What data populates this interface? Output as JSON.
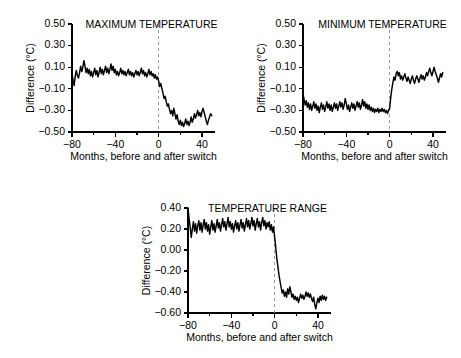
{
  "figure": {
    "background": "#ffffff",
    "line_color": "#000000",
    "switch_marker_color": "#9a9a9a"
  },
  "chart_data": [
    {
      "type": "line",
      "id": "maximum-temperature",
      "title": "MAXIMUM TEMPERATURE",
      "xlabel": "Months, before and after switch",
      "ylabel": "Difference (°C)",
      "xlim": [
        -80,
        52
      ],
      "ylim": [
        -0.5,
        0.5
      ],
      "xticks": [
        -80,
        -40,
        0,
        40
      ],
      "xtick_labels": [
        "−80",
        "−40",
        "0",
        "40"
      ],
      "xminor_ticks": [
        -60,
        -20,
        20
      ],
      "yticks": [
        0.5,
        0.3,
        0.1,
        -0.1,
        -0.3,
        -0.5
      ],
      "ytick_labels": [
        "0.50",
        "0.30",
        "0.10",
        "−0.10",
        "−0.30",
        "−0.50"
      ],
      "grid": false,
      "annotations": [
        {
          "type": "vline",
          "x": 0,
          "style": "dashed",
          "label": "switch"
        }
      ],
      "x": [
        -80,
        -79,
        -78,
        -77,
        -76,
        -75,
        -74,
        -73,
        -72,
        -71,
        -70,
        -69,
        -68,
        -67,
        -66,
        -65,
        -64,
        -63,
        -62,
        -61,
        -60,
        -59,
        -58,
        -57,
        -56,
        -55,
        -54,
        -53,
        -52,
        -51,
        -50,
        -49,
        -48,
        -47,
        -46,
        -45,
        -44,
        -43,
        -42,
        -41,
        -40,
        -39,
        -38,
        -37,
        -36,
        -35,
        -34,
        -33,
        -32,
        -31,
        -30,
        -29,
        -28,
        -27,
        -26,
        -25,
        -24,
        -23,
        -22,
        -21,
        -20,
        -19,
        -18,
        -17,
        -16,
        -15,
        -14,
        -13,
        -12,
        -11,
        -10,
        -9,
        -8,
        -7,
        -6,
        -5,
        -4,
        -3,
        -2,
        -1,
        0,
        1,
        2,
        3,
        4,
        5,
        6,
        7,
        8,
        9,
        10,
        11,
        12,
        13,
        14,
        15,
        16,
        17,
        18,
        19,
        20,
        21,
        22,
        23,
        24,
        25,
        26,
        27,
        28,
        29,
        30,
        31,
        32,
        33,
        34,
        35,
        36,
        37,
        38,
        39,
        40,
        41,
        42,
        43,
        44,
        45,
        46,
        47,
        48,
        49,
        50,
        51,
        52
      ],
      "y": [
        0.04,
        -0.02,
        -0.07,
        0.02,
        0.07,
        0.02,
        0.0,
        0.05,
        0.11,
        0.06,
        0.1,
        0.16,
        0.11,
        0.05,
        0.09,
        0.04,
        0.08,
        0.02,
        0.06,
        0.01,
        0.05,
        0.09,
        0.03,
        0.07,
        0.01,
        0.05,
        0.1,
        0.04,
        0.08,
        0.03,
        0.07,
        0.11,
        0.05,
        0.09,
        0.04,
        0.08,
        0.13,
        0.07,
        0.11,
        0.05,
        0.08,
        0.03,
        0.06,
        0.02,
        0.05,
        0.09,
        0.04,
        0.07,
        0.03,
        0.06,
        0.02,
        0.05,
        0.08,
        0.03,
        0.06,
        0.02,
        0.05,
        0.01,
        0.04,
        0.07,
        0.03,
        0.06,
        0.02,
        0.05,
        0.09,
        0.04,
        0.07,
        0.02,
        0.05,
        0.01,
        0.04,
        0.08,
        0.03,
        0.06,
        0.02,
        0.04,
        0.0,
        0.03,
        -0.01,
        0.01,
        -0.03,
        -0.08,
        -0.05,
        -0.1,
        -0.14,
        -0.19,
        -0.17,
        -0.22,
        -0.26,
        -0.24,
        -0.29,
        -0.33,
        -0.3,
        -0.35,
        -0.28,
        -0.33,
        -0.38,
        -0.34,
        -0.4,
        -0.43,
        -0.39,
        -0.44,
        -0.41,
        -0.45,
        -0.42,
        -0.38,
        -0.43,
        -0.4,
        -0.44,
        -0.41,
        -0.36,
        -0.41,
        -0.38,
        -0.33,
        -0.37,
        -0.34,
        -0.3,
        -0.35,
        -0.32,
        -0.36,
        -0.31,
        -0.28,
        -0.32,
        -0.36,
        -0.4,
        -0.43,
        -0.39,
        -0.36,
        -0.33,
        -0.35
      ]
    },
    {
      "type": "line",
      "id": "minimum-temperature",
      "title": "MINIMUM TEMPERATURE",
      "xlabel": "Months, before and after switch",
      "ylabel": "Difference (°C)",
      "xlim": [
        -80,
        52
      ],
      "ylim": [
        -0.5,
        0.5
      ],
      "xticks": [
        -80,
        -40,
        0,
        40
      ],
      "xtick_labels": [
        "−80",
        "−40",
        "0",
        "40"
      ],
      "xminor_ticks": [
        -60,
        -20,
        20
      ],
      "yticks": [
        0.5,
        0.3,
        0.1,
        -0.1,
        -0.3,
        -0.5
      ],
      "ytick_labels": [
        "0.50",
        "0.30",
        "0.10",
        "−0.10",
        "−0.30",
        "−0.50"
      ],
      "grid": false,
      "annotations": [
        {
          "type": "vline",
          "x": 0,
          "style": "dashed",
          "label": "switch"
        }
      ],
      "x": [
        -80,
        -79,
        -78,
        -77,
        -76,
        -75,
        -74,
        -73,
        -72,
        -71,
        -70,
        -69,
        -68,
        -67,
        -66,
        -65,
        -64,
        -63,
        -62,
        -61,
        -60,
        -59,
        -58,
        -57,
        -56,
        -55,
        -54,
        -53,
        -52,
        -51,
        -50,
        -49,
        -48,
        -47,
        -46,
        -45,
        -44,
        -43,
        -42,
        -41,
        -40,
        -39,
        -38,
        -37,
        -36,
        -35,
        -34,
        -33,
        -32,
        -31,
        -30,
        -29,
        -28,
        -27,
        -26,
        -25,
        -24,
        -23,
        -22,
        -21,
        -20,
        -19,
        -18,
        -17,
        -16,
        -15,
        -14,
        -13,
        -12,
        -11,
        -10,
        -9,
        -8,
        -7,
        -6,
        -5,
        -4,
        -3,
        -2,
        -1,
        0,
        1,
        2,
        3,
        4,
        5,
        6,
        7,
        8,
        9,
        10,
        11,
        12,
        13,
        14,
        15,
        16,
        17,
        18,
        19,
        20,
        21,
        22,
        23,
        24,
        25,
        26,
        27,
        28,
        29,
        30,
        31,
        32,
        33,
        34,
        35,
        36,
        37,
        38,
        39,
        40,
        41,
        42,
        43,
        44,
        45,
        46,
        47,
        48,
        49,
        50,
        51,
        52
      ],
      "y": [
        -0.14,
        -0.2,
        -0.25,
        -0.21,
        -0.27,
        -0.23,
        -0.29,
        -0.24,
        -0.3,
        -0.26,
        -0.22,
        -0.28,
        -0.24,
        -0.3,
        -0.26,
        -0.32,
        -0.27,
        -0.23,
        -0.29,
        -0.25,
        -0.31,
        -0.27,
        -0.22,
        -0.28,
        -0.24,
        -0.3,
        -0.25,
        -0.31,
        -0.27,
        -0.23,
        -0.28,
        -0.24,
        -0.3,
        -0.26,
        -0.22,
        -0.27,
        -0.23,
        -0.29,
        -0.25,
        -0.19,
        -0.24,
        -0.29,
        -0.25,
        -0.31,
        -0.27,
        -0.23,
        -0.28,
        -0.24,
        -0.3,
        -0.26,
        -0.22,
        -0.27,
        -0.23,
        -0.29,
        -0.25,
        -0.2,
        -0.26,
        -0.22,
        -0.28,
        -0.24,
        -0.29,
        -0.25,
        -0.3,
        -0.27,
        -0.31,
        -0.28,
        -0.32,
        -0.29,
        -0.31,
        -0.28,
        -0.32,
        -0.29,
        -0.31,
        -0.28,
        -0.31,
        -0.29,
        -0.32,
        -0.3,
        -0.33,
        -0.3,
        -0.28,
        -0.18,
        -0.1,
        -0.04,
        0.01,
        -0.02,
        0.04,
        0.06,
        0.02,
        0.05,
        -0.01,
        0.02,
        -0.02,
        0.01,
        0.04,
        0.0,
        -0.03,
        0.01,
        -0.02,
        -0.05,
        -0.01,
        0.02,
        -0.02,
        -0.05,
        -0.01,
        0.02,
        -0.01,
        -0.04,
        0.0,
        0.03,
        -0.01,
        0.02,
        -0.02,
        0.01,
        0.05,
        0.02,
        0.06,
        0.09,
        0.05,
        0.02,
        0.06,
        0.1,
        0.06,
        0.03,
        0.0,
        -0.04,
        0.0,
        0.04,
        0.01,
        0.05
      ]
    },
    {
      "type": "line",
      "id": "temperature-range",
      "title": "TEMPERATURE RANGE",
      "xlabel": "Months, before and after switch",
      "ylabel": "Difference (°C)",
      "xlim": [
        -80,
        52
      ],
      "ylim": [
        -0.6,
        0.4
      ],
      "xticks": [
        -80,
        -40,
        0,
        40
      ],
      "xtick_labels": [
        "−80",
        "−40",
        "0",
        "40"
      ],
      "xminor_ticks": [
        -60,
        -20,
        20
      ],
      "yticks": [
        0.4,
        0.2,
        0.0,
        -0.2,
        -0.4,
        -0.6
      ],
      "ytick_labels": [
        "0.40",
        "0.20",
        "0.00",
        "−0.20",
        "−0.40",
        "−0.60"
      ],
      "grid": false,
      "annotations": [
        {
          "type": "vline",
          "x": 0,
          "style": "dashed",
          "label": "switch"
        }
      ],
      "x": [
        -80,
        -79,
        -78,
        -77,
        -76,
        -75,
        -74,
        -73,
        -72,
        -71,
        -70,
        -69,
        -68,
        -67,
        -66,
        -65,
        -64,
        -63,
        -62,
        -61,
        -60,
        -59,
        -58,
        -57,
        -56,
        -55,
        -54,
        -53,
        -52,
        -51,
        -50,
        -49,
        -48,
        -47,
        -46,
        -45,
        -44,
        -43,
        -42,
        -41,
        -40,
        -39,
        -38,
        -37,
        -36,
        -35,
        -34,
        -33,
        -32,
        -31,
        -30,
        -29,
        -28,
        -27,
        -26,
        -25,
        -24,
        -23,
        -22,
        -21,
        -20,
        -19,
        -18,
        -17,
        -16,
        -15,
        -14,
        -13,
        -12,
        -11,
        -10,
        -9,
        -8,
        -7,
        -6,
        -5,
        -4,
        -3,
        -2,
        -1,
        0,
        1,
        2,
        3,
        4,
        5,
        6,
        7,
        8,
        9,
        10,
        11,
        12,
        13,
        14,
        15,
        16,
        17,
        18,
        19,
        20,
        21,
        22,
        23,
        24,
        25,
        26,
        27,
        28,
        29,
        30,
        31,
        32,
        33,
        34,
        35,
        36,
        37,
        38,
        39,
        40,
        41,
        42,
        43,
        44,
        45,
        46,
        47,
        48,
        49,
        50,
        51,
        52
      ],
      "y": [
        0.4,
        0.3,
        0.22,
        0.12,
        0.2,
        0.27,
        0.18,
        0.25,
        0.16,
        0.23,
        0.28,
        0.19,
        0.26,
        0.17,
        0.24,
        0.29,
        0.2,
        0.26,
        0.18,
        0.24,
        0.15,
        0.22,
        0.28,
        0.19,
        0.25,
        0.17,
        0.23,
        0.29,
        0.21,
        0.26,
        0.18,
        0.24,
        0.3,
        0.22,
        0.27,
        0.19,
        0.25,
        0.31,
        0.22,
        0.27,
        0.2,
        0.25,
        0.17,
        0.23,
        0.28,
        0.2,
        0.26,
        0.18,
        0.24,
        0.29,
        0.21,
        0.26,
        0.18,
        0.24,
        0.3,
        0.22,
        0.28,
        0.2,
        0.25,
        0.31,
        0.23,
        0.28,
        0.19,
        0.25,
        0.3,
        0.22,
        0.27,
        0.19,
        0.26,
        0.31,
        0.23,
        0.28,
        0.2,
        0.26,
        0.22,
        0.27,
        0.19,
        0.24,
        0.17,
        0.22,
        0.12,
        0.02,
        -0.08,
        -0.16,
        -0.24,
        -0.3,
        -0.36,
        -0.41,
        -0.38,
        -0.44,
        -0.4,
        -0.45,
        -0.37,
        -0.42,
        -0.35,
        -0.4,
        -0.45,
        -0.42,
        -0.47,
        -0.44,
        -0.48,
        -0.45,
        -0.5,
        -0.46,
        -0.42,
        -0.46,
        -0.43,
        -0.47,
        -0.44,
        -0.4,
        -0.44,
        -0.41,
        -0.45,
        -0.42,
        -0.46,
        -0.49,
        -0.45,
        -0.52,
        -0.56,
        -0.5,
        -0.46,
        -0.5,
        -0.44,
        -0.48,
        -0.43,
        -0.47,
        -0.44,
        -0.48,
        -0.45
      ]
    }
  ]
}
